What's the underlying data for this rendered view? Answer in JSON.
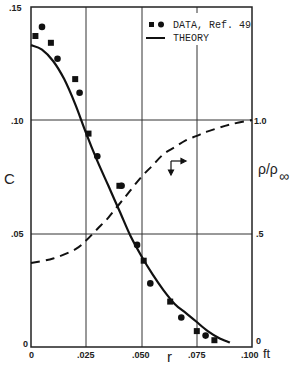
{
  "chart_data": {
    "type": "line",
    "title": "",
    "xlabel": "r",
    "x_unit": "ft",
    "ylabel": "C",
    "y2label": "ρ/ρ∞",
    "xlim": [
      0,
      0.1
    ],
    "ylim": [
      0,
      0.15
    ],
    "y2lim": [
      0,
      1.0
    ],
    "x_ticks": [
      "0",
      ".025",
      ".050",
      ".075",
      ".100"
    ],
    "y_ticks": [
      "0",
      ".05",
      ".10",
      ".15"
    ],
    "y2_ticks": [
      "0",
      ".5",
      "1.0"
    ],
    "grid": true,
    "legend_position": "upper right",
    "legend": [
      {
        "label": "DATA, Ref. 49",
        "style": "markers (squares and circles)"
      },
      {
        "label": "THEORY",
        "style": "solid line"
      }
    ],
    "series": [
      {
        "name": "THEORY",
        "axis": "left",
        "style": "solid",
        "x": [
          0,
          0.005,
          0.01,
          0.015,
          0.02,
          0.025,
          0.03,
          0.035,
          0.04,
          0.045,
          0.05,
          0.055,
          0.06,
          0.065,
          0.07,
          0.075,
          0.08,
          0.085,
          0.09
        ],
        "values": [
          0.133,
          0.131,
          0.126,
          0.118,
          0.107,
          0.094,
          0.082,
          0.071,
          0.06,
          0.049,
          0.04,
          0.032,
          0.025,
          0.019,
          0.015,
          0.011,
          0.007,
          0.004,
          0.002
        ]
      },
      {
        "name": "DATA, Ref. 49 (squares)",
        "axis": "left",
        "style": "square markers",
        "x": [
          0.002,
          0.009,
          0.02,
          0.026,
          0.04,
          0.051,
          0.063,
          0.075,
          0.083
        ],
        "values": [
          0.137,
          0.134,
          0.118,
          0.094,
          0.071,
          0.038,
          0.02,
          0.007,
          0.003
        ]
      },
      {
        "name": "DATA, Ref. 49 (circles)",
        "axis": "left",
        "style": "circle markers",
        "x": [
          0.005,
          0.012,
          0.022,
          0.03,
          0.041,
          0.048,
          0.054,
          0.068,
          0.079
        ],
        "values": [
          0.141,
          0.127,
          0.112,
          0.084,
          0.071,
          0.045,
          0.028,
          0.013,
          0.005
        ]
      },
      {
        "name": "ρ/ρ∞",
        "axis": "right",
        "style": "dashed",
        "x": [
          0,
          0.01,
          0.02,
          0.025,
          0.03,
          0.035,
          0.04,
          0.045,
          0.05,
          0.055,
          0.06,
          0.065,
          0.07,
          0.075,
          0.08,
          0.09,
          0.1
        ],
        "values": [
          0.37,
          0.39,
          0.43,
          0.47,
          0.52,
          0.57,
          0.63,
          0.69,
          0.75,
          0.8,
          0.85,
          0.88,
          0.91,
          0.93,
          0.95,
          0.98,
          1.0
        ]
      }
    ],
    "annotations": [
      {
        "type": "arrow",
        "at": {
          "x": 0.065,
          "y2": 0.88
        },
        "directions": [
          "right",
          "down"
        ],
        "meaning": "dashed curve read on right axis"
      }
    ]
  },
  "labels": {
    "c_axis": "C",
    "r_axis": "r",
    "x_unit": "ft",
    "rho_axis": "ρ/ρ",
    "rho_sub": "∞",
    "legend_data": "DATA, Ref. 49",
    "legend_theory": "THEORY",
    "x_ticks": [
      "0",
      ".025",
      ".050",
      ".075",
      ".100"
    ],
    "y_ticks": [
      "0",
      ".05",
      ".10",
      ".15"
    ],
    "y2_ticks": [
      "0",
      ".5",
      "1.0"
    ]
  }
}
